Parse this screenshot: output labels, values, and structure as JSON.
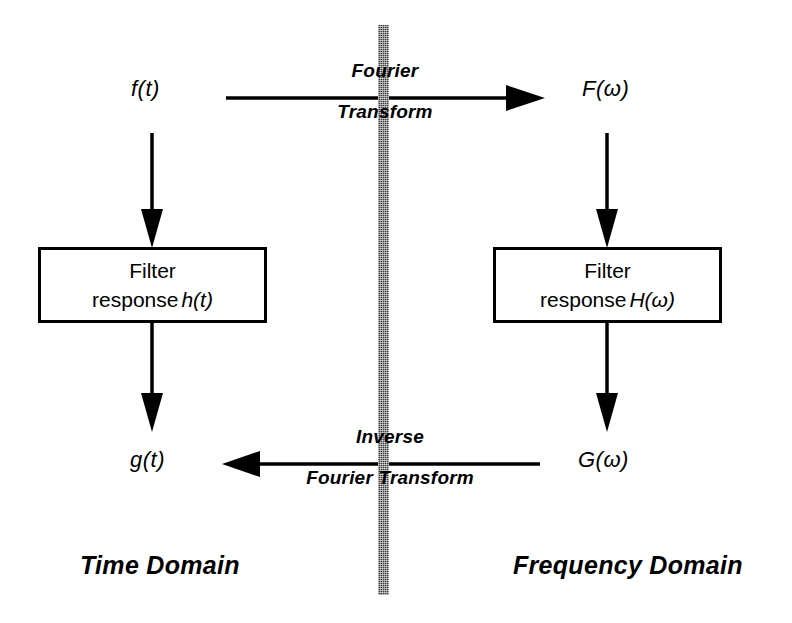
{
  "figure": {
    "background_color": "#ffffff",
    "stroke_color": "#000000"
  },
  "divider": {
    "name": "domain-divider",
    "color": "#3a3a3a",
    "style": "dithered vertical band"
  },
  "signals": {
    "time_input": "f(t)",
    "freq_input": "F(ω)",
    "time_output": "g(t)",
    "freq_output": "G(ω)"
  },
  "boxes": {
    "time_filter": {
      "line1": "Filter",
      "line2_prefix": "response",
      "line2_symbol": "h(t)"
    },
    "freq_filter": {
      "line1": "Filter",
      "line2_prefix": "response",
      "line2_symbol": "H(ω)"
    }
  },
  "arrows": {
    "forward": {
      "label_top": "Fourier",
      "label_bottom": "Transform",
      "direction": "right"
    },
    "inverse": {
      "label_top": "Inverse",
      "label_bottom": "Fourier Transform",
      "direction": "left"
    },
    "time_down_1": {
      "direction": "down"
    },
    "time_down_2": {
      "direction": "down"
    },
    "freq_down_1": {
      "direction": "down"
    },
    "freq_down_2": {
      "direction": "down"
    }
  },
  "domains": {
    "left": "Time Domain",
    "right": "Frequency Domain"
  }
}
